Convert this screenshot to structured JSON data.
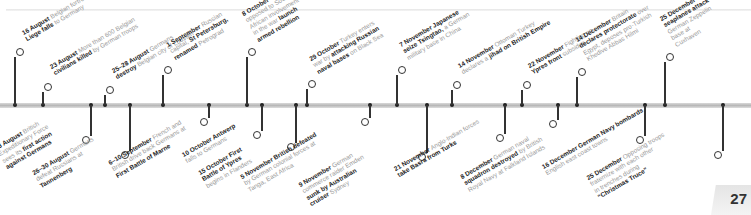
{
  "page": {
    "number": "27"
  },
  "timeline": {
    "top_events": [
      {
        "date": "16 August",
        "text": [
          "Belgian fortress of",
          "Liege falls to Germany"
        ],
        "bold_words": "Liege falls"
      },
      {
        "date": "23 August",
        "text": [
          "More than 600 Belgian",
          "civilians killed by German troops"
        ],
        "bold_words": "civilians killed"
      },
      {
        "date": "25–28 August",
        "text": [
          "Germans",
          "destroy Belgian city of Louvain"
        ],
        "bold_words": "destroy"
      },
      {
        "date": "1 September",
        "text": [
          "Russian",
          "capital, St Petersburg,",
          "renamed Petrograd"
        ],
        "bold_words": "St Petersburg, renamed"
      },
      {
        "date": "8 October",
        "text": [
          "Boers",
          "opposed to South",
          "African involvement",
          "in the war launch",
          "armed rebellion"
        ],
        "bold_words": "launch armed rebellion"
      },
      {
        "date": "29 October",
        "text": [
          "Turkey enters",
          "war by attacking Russian",
          "naval bases on Black Sea"
        ],
        "bold_words": "attacking Russian naval bases"
      },
      {
        "date": "7 November",
        "text": [
          "Japanese",
          "seize Tsingtao, a German",
          "military base in China"
        ],
        "bold_words": "Japanese seize Tsingtao"
      },
      {
        "date": "14 November",
        "text": [
          "Ottoman Turkey",
          "declares a jihad on British Empire"
        ],
        "bold_words": "jihad on British Empire"
      },
      {
        "date": "22 November",
        "text": [
          "Fighting on",
          "Ypres front subsides"
        ],
        "bold_words": "Ypres front"
      },
      {
        "date": "14 December",
        "text": [
          "Britain",
          "declares protectorate over",
          "Egypt, deposes pro-Turkish",
          "Khedive Abbas Hilmi"
        ],
        "bold_words": "declares protectorate"
      },
      {
        "date": "25 December",
        "text": [
          "Royal Navy",
          "seaplanes attack",
          "German Zeppelin",
          "base at",
          "Cuxhaven"
        ],
        "bold_words": "Royal Navy seaplanes attack"
      }
    ],
    "bottom_events": [
      {
        "date": "23 August",
        "text": [
          "British",
          "Expeditionary Force",
          "sees its first action",
          "against Germans"
        ],
        "bold_words": "first action against Germans"
      },
      {
        "date": "26–30 August",
        "text": [
          "Germans",
          "defeat Russians at",
          "Tannenberg"
        ],
        "bold_words": "Tannenberg"
      },
      {
        "date": "6–10 September",
        "text": [
          "French and",
          "British drive back Germans at",
          "First Battle of Marne"
        ],
        "bold_words": "First Battle of Marne"
      },
      {
        "date": "10 October",
        "text": [
          "Antwerp",
          "falls to Germans"
        ],
        "bold_words": "Antwerp"
      },
      {
        "date": "15 October",
        "text": [
          "First",
          "Battle of Ypres",
          "begins in Flanders"
        ],
        "bold_words": "First Battle of Ypres"
      },
      {
        "date": "5 November",
        "text": [
          "British defeated",
          "by German colonial forces at",
          "Tanga, East Africa"
        ],
        "bold_words": "British defeated"
      },
      {
        "date": "9 November",
        "text": [
          "German",
          "commerce raider Emden",
          "sunk by Australian",
          "cruiser Sydney"
        ],
        "bold_words": "sunk by Australian cruiser"
      },
      {
        "date": "21 November",
        "text": [
          "Anglo-Indian forces",
          "take Basra from Turks"
        ],
        "bold_words": "take Basra from Turks"
      },
      {
        "date": "8 December",
        "text": [
          "German naval",
          "squadron destroyed by British",
          "Royal Navy at Falkland Islands"
        ],
        "bold_words": "squadron destroyed"
      },
      {
        "date": "16 December",
        "text": [
          "German Navy bombards",
          "English east coast towns"
        ],
        "bold_words": "German Navy bombards"
      },
      {
        "date": "25 December",
        "text": [
          "Opposing troops",
          "fraternize with each other",
          "in trenches during",
          "“Christmas Truce”"
        ],
        "bold_words": "Christmas Truce"
      }
    ]
  }
}
